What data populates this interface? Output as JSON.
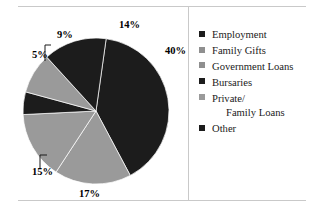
{
  "chart_data": {
    "type": "pie",
    "title": "",
    "categories": [
      "Employment",
      "Family Gifts",
      "Government Loans",
      "Bursaries",
      "Private/ Family Loans",
      "Other"
    ],
    "values": [
      40,
      17,
      15,
      5,
      9,
      14
    ],
    "value_labels": [
      "40%",
      "17%",
      "15%",
      "5%",
      "9%",
      "14%"
    ],
    "colors": [
      "#1c1c1c",
      "#9a9a9a",
      "#9a9a9a",
      "#1c1c1c",
      "#9a9a9a",
      "#1c1c1c"
    ],
    "legend_position": "right",
    "grid": false,
    "units": "percent"
  },
  "pie": {
    "labels": [
      {
        "text": "14%",
        "x": 101,
        "y": 12
      },
      {
        "text": "40%",
        "x": 147,
        "y": 38
      },
      {
        "text": "17%",
        "x": 61,
        "y": 181
      },
      {
        "text": "15%",
        "x": 14,
        "y": 159
      },
      {
        "text": "5%",
        "x": 14,
        "y": 42
      },
      {
        "text": "9%",
        "x": 39,
        "y": 22
      }
    ],
    "slices": [
      {
        "name": "Employment",
        "value": 40,
        "color": "#1c1c1c"
      },
      {
        "name": "Family Gifts",
        "value": 17,
        "color": "#9a9a9a"
      },
      {
        "name": "Government Loans",
        "value": 15,
        "color": "#9a9a9a"
      },
      {
        "name": "Bursaries",
        "value": 5,
        "color": "#1c1c1c"
      },
      {
        "name": "Private/Family Loans",
        "value": 9,
        "color": "#9a9a9a"
      },
      {
        "name": "Other",
        "value": 14,
        "color": "#1c1c1c"
      }
    ]
  },
  "legend": {
    "items": [
      {
        "label": "Employment",
        "label2": "",
        "color": "#1c1c1c"
      },
      {
        "label": "Family Gifts",
        "label2": "",
        "color": "#8f8f8f"
      },
      {
        "label": "Government Loans",
        "label2": "",
        "color": "#8f8f8f"
      },
      {
        "label": "Bursaries",
        "label2": "",
        "color": "#1c1c1c"
      },
      {
        "label": "Private/",
        "label2": "Family Loans",
        "color": "#9a9a9a"
      },
      {
        "label": "Other",
        "label2": "",
        "color": "#1c1c1c"
      }
    ]
  },
  "colors": {
    "dark": "#1c1c1c",
    "gray": "#9a9a9a",
    "rule": "#c9c9c9",
    "background": "#ffffff",
    "text": "#1a1a1a"
  }
}
